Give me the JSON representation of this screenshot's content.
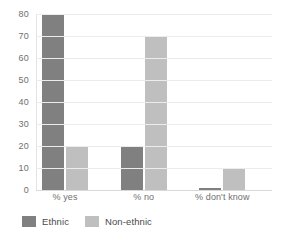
{
  "chart_data": {
    "type": "bar",
    "title": "",
    "subtitle": "",
    "xlabel": "",
    "ylabel": "",
    "categories": [
      "% yes",
      "% no",
      "% don't know"
    ],
    "series": [
      {
        "name": "Ethnic",
        "color": "#808080",
        "values": [
          80,
          20,
          1
        ]
      },
      {
        "name": "Non-ethnic",
        "color": "#bfbfbf",
        "values": [
          20,
          70,
          10
        ]
      }
    ],
    "ylim": [
      0,
      80
    ],
    "y_ticks": [
      0,
      10,
      20,
      30,
      40,
      50,
      60,
      70,
      80
    ],
    "y_tick_labels": [
      "0",
      "10",
      "20",
      "30",
      "40",
      "50",
      "60",
      "70",
      "80"
    ],
    "grid": {
      "horizontal": true,
      "vertical": false
    },
    "legend": {
      "position": "bottom-left",
      "entries": [
        "Ethnic",
        "Non-ethnic"
      ]
    },
    "background": "#ffffff"
  }
}
